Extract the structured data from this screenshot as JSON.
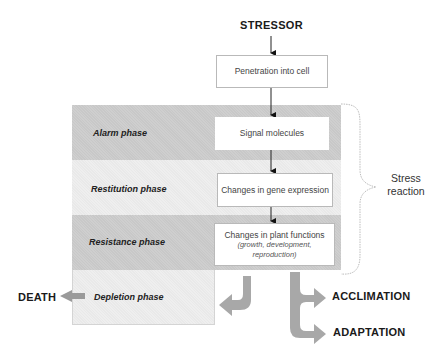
{
  "stressor": {
    "label": "STRESSOR"
  },
  "steps": [
    {
      "id": "penetration",
      "label": "Penetration into cell"
    },
    {
      "id": "signal",
      "label": "Signal molecules"
    },
    {
      "id": "gene",
      "label": "Changes in gene expression"
    },
    {
      "id": "plant",
      "label": "Changes in plant functions",
      "sublabel": "(growth, development, reproduction)"
    }
  ],
  "phases": [
    {
      "id": "alarm",
      "label": "Alarm phase"
    },
    {
      "id": "restitution",
      "label": "Restitution phase"
    },
    {
      "id": "resistance",
      "label": "Resistance phase"
    },
    {
      "id": "depletion",
      "label": "Depletion phase"
    }
  ],
  "bracket": {
    "label_line1": "Stress",
    "label_line2": "reaction"
  },
  "outcomes": {
    "death": "DEATH",
    "acclimation": "ACCLIMATION",
    "adaptation": "ADAPTATION"
  },
  "colors": {
    "phase_dark": "#c8c8c8",
    "phase_light": "#e9e9e9",
    "arrow_fat": "#a8a8a8",
    "box_border": "#b9b9b9"
  }
}
